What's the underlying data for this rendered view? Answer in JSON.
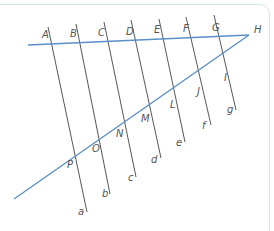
{
  "diagram": {
    "colors": {
      "transversal": "#444444",
      "blue_line": "#5b8fc7",
      "frame": "#cfe9e6",
      "label": "#555555"
    },
    "upper_line": {
      "x1": 28,
      "y1": 45,
      "x2": 249,
      "y2": 35
    },
    "lower_line": {
      "x1": 14,
      "y1": 199,
      "x2": 249,
      "y2": 35
    },
    "transversals": [
      {
        "name": "a",
        "x1": 48,
        "y1": 27,
        "x2": 87,
        "y2": 212
      },
      {
        "name": "b",
        "x1": 76,
        "y1": 24,
        "x2": 110,
        "y2": 194
      },
      {
        "name": "c",
        "x1": 104,
        "y1": 22,
        "x2": 136,
        "y2": 177
      },
      {
        "name": "d",
        "x1": 131,
        "y1": 20,
        "x2": 161,
        "y2": 158
      },
      {
        "name": "e",
        "x1": 159,
        "y1": 19,
        "x2": 185,
        "y2": 142
      },
      {
        "name": "f",
        "x1": 186,
        "y1": 17,
        "x2": 211,
        "y2": 125
      },
      {
        "name": "g",
        "x1": 214,
        "y1": 15,
        "x2": 236,
        "y2": 110
      }
    ],
    "point_labels": [
      {
        "text": "A",
        "x": 42,
        "y": 38
      },
      {
        "text": "B",
        "x": 70,
        "y": 37
      },
      {
        "text": "C",
        "x": 98,
        "y": 36
      },
      {
        "text": "D",
        "x": 126,
        "y": 35
      },
      {
        "text": "E",
        "x": 154,
        "y": 33
      },
      {
        "text": "F",
        "x": 183,
        "y": 32
      },
      {
        "text": "G",
        "x": 212,
        "y": 31
      },
      {
        "text": "H",
        "x": 254,
        "y": 33
      },
      {
        "text": "I",
        "x": 224,
        "y": 81
      },
      {
        "text": "J",
        "x": 197,
        "y": 95
      },
      {
        "text": "L",
        "x": 170,
        "y": 108
      },
      {
        "text": "M",
        "x": 141,
        "y": 122
      },
      {
        "text": "N",
        "x": 116,
        "y": 137
      },
      {
        "text": "O",
        "x": 92,
        "y": 152
      },
      {
        "text": "P",
        "x": 67,
        "y": 168
      }
    ],
    "line_labels": [
      {
        "text": "a",
        "x": 78,
        "y": 215
      },
      {
        "text": "b",
        "x": 102,
        "y": 197
      },
      {
        "text": "c",
        "x": 128,
        "y": 181
      },
      {
        "text": "d",
        "x": 151,
        "y": 163
      },
      {
        "text": "e",
        "x": 176,
        "y": 146
      },
      {
        "text": "f",
        "x": 202,
        "y": 129
      },
      {
        "text": "g",
        "x": 227,
        "y": 113
      }
    ]
  }
}
